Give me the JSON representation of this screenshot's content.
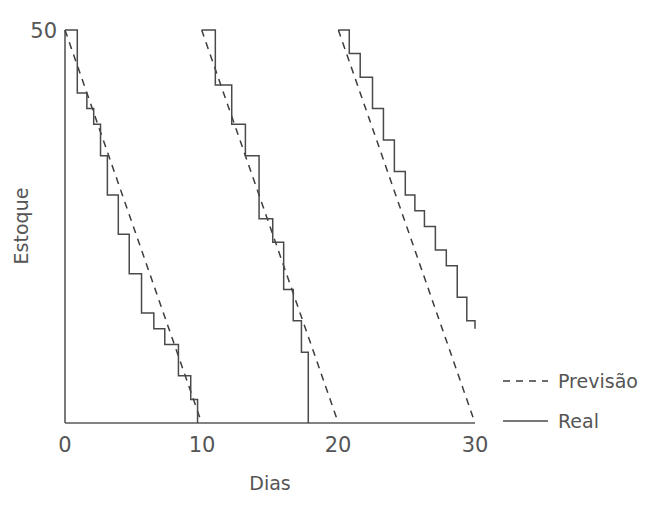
{
  "chart_data": {
    "type": "line",
    "title": "",
    "xlabel": "Dias",
    "ylabel": "Estoque",
    "xlim": [
      0,
      30
    ],
    "ylim": [
      0,
      50
    ],
    "xticks": [
      0,
      10,
      20,
      30
    ],
    "xtick_labels": [
      "0",
      "10",
      "20",
      "30"
    ],
    "yticks": [
      50
    ],
    "ytick_labels": [
      "50"
    ],
    "grid": false,
    "legend_position": "right",
    "legend": [
      {
        "name": "Previsão",
        "style": "dashed"
      },
      {
        "name": "Real",
        "style": "solid"
      }
    ],
    "series": [
      {
        "name": "Previsão",
        "style": "dashed",
        "description": "Consumo previsto linear: 50 unidades em 10 dias por ciclo",
        "segments": [
          {
            "x": [
              0,
              10
            ],
            "y": [
              50,
              0
            ]
          },
          {
            "x": [
              10,
              20
            ],
            "y": [
              50,
              0
            ]
          },
          {
            "x": [
              20,
              30
            ],
            "y": [
              50,
              0
            ]
          }
        ]
      },
      {
        "name": "Real",
        "style": "solid",
        "description": "Consumo real em degraus (step) por ciclo de reposição",
        "steps": [
          {
            "cycle": 1,
            "x": [
              0.0,
              0.9,
              1.6,
              2.1,
              2.6,
              3.1,
              3.9,
              4.7,
              5.6,
              6.5,
              7.3,
              8.3,
              9.2,
              9.7
            ],
            "y": [
              50,
              42,
              40,
              38,
              34,
              29,
              24,
              19,
              14,
              12,
              10,
              6,
              3,
              0
            ]
          },
          {
            "cycle": 2,
            "x": [
              10.0,
              11.0,
              12.2,
              13.2,
              14.2,
              15.2,
              16.0,
              16.7,
              17.3,
              17.8
            ],
            "y": [
              50,
              43,
              38,
              34,
              26,
              23,
              17,
              13,
              9,
              0
            ]
          },
          {
            "cycle": 3,
            "x": [
              20.0,
              20.8,
              21.6,
              22.5,
              23.3,
              24.1,
              24.9,
              25.6,
              26.3,
              27.1,
              27.9,
              28.7,
              29.4,
              30.0
            ],
            "y": [
              50,
              47,
              44,
              40,
              36,
              32,
              29,
              27,
              25,
              22,
              20,
              16,
              13,
              12
            ]
          }
        ]
      }
    ],
    "colors": {
      "real": "#4a4a4a",
      "forecast": "#3d3d3d",
      "axis": "#595959",
      "text": "#555555",
      "background": "#ffffff"
    }
  }
}
